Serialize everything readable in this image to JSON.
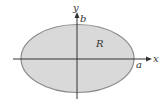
{
  "diagram": {
    "region_label": "R",
    "x_axis_label": "x",
    "y_axis_label": "y",
    "semi_major_label": "a",
    "semi_minor_label": "b",
    "colors": {
      "fill": "#d9d9d9",
      "stroke": "#8c8c8c",
      "axis": "#333333"
    }
  }
}
